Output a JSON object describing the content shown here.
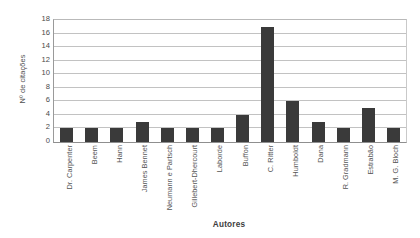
{
  "chart_data": {
    "type": "bar",
    "title": "",
    "xlabel": "Autores",
    "ylabel": "Nº de citações",
    "categories": [
      "Dr. Carpenter",
      "Beem",
      "Hann",
      "James Bennet",
      "Neumann e Partsch",
      "Gillebert-Dhercourt",
      "Laborde",
      "Buffon",
      "C. Ritter",
      "Humboldt",
      "Dana",
      "R. Gradmann",
      "Estrabão",
      "M. G. Bloch"
    ],
    "values": [
      2,
      2,
      2,
      3,
      2,
      2,
      2,
      4,
      17,
      6,
      3,
      2,
      5,
      2
    ],
    "ylim": [
      0,
      18
    ],
    "yticks": [
      0,
      2,
      4,
      6,
      8,
      10,
      12,
      14,
      16,
      18
    ],
    "ytick_labels": [
      "0",
      "2",
      "4",
      "6",
      "8",
      "10",
      "12",
      "14",
      "16",
      "18"
    ],
    "grid": "horizontal",
    "legend": "none",
    "bar_color": "#3a3a3a",
    "background_color": "#ffffff",
    "gridline_color": "#c2c2c2",
    "axis_color": "#8f8f8f"
  }
}
